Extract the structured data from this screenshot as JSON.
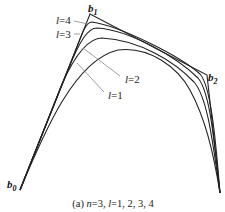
{
  "figure": {
    "caption_prefix": "(a) ",
    "caption_n": "n",
    "caption_mid": "=3, ",
    "caption_l": "l",
    "caption_rest": "=1, 2, 3, 4",
    "control_points": [
      {
        "name": "b",
        "sub": "0",
        "x": 20,
        "y": 190
      },
      {
        "name": "b",
        "sub": "1",
        "x": 90,
        "y": 14
      },
      {
        "name": "b",
        "sub": "2",
        "x": 207,
        "y": 75
      },
      {
        "name": "",
        "sub": "",
        "x": 220,
        "y": 193
      }
    ],
    "curve_labels": [
      {
        "var": "l",
        "val": "=4"
      },
      {
        "var": "l",
        "val": "=3"
      },
      {
        "var": "l",
        "val": "=2"
      },
      {
        "var": "l",
        "val": "=1"
      }
    ],
    "colors": {
      "curve": "#222222",
      "leader": "#888888"
    }
  }
}
